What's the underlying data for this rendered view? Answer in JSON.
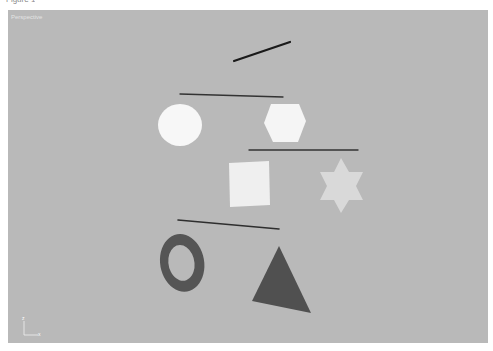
{
  "window": {
    "caption": "Figure 1"
  },
  "viewport": {
    "label": "Perspective",
    "background": "#b9b9b9"
  },
  "axis_gizmo": {
    "up_label": "z",
    "right_label": "x"
  },
  "scene": {
    "objects": [
      {
        "name": "line-1",
        "type": "line",
        "color": "#1a1a1a"
      },
      {
        "name": "line-2",
        "type": "line",
        "color": "#333333"
      },
      {
        "name": "circle",
        "type": "disc",
        "color": "#f7f7f7"
      },
      {
        "name": "hexagon",
        "type": "hexagon",
        "color": "#f5f5f5"
      },
      {
        "name": "line-3",
        "type": "line",
        "color": "#333333"
      },
      {
        "name": "square",
        "type": "plane",
        "color": "#efefef"
      },
      {
        "name": "star",
        "type": "star",
        "color": "#d9d9d9"
      },
      {
        "name": "line-4",
        "type": "line",
        "color": "#2e2e2e"
      },
      {
        "name": "torus",
        "type": "ring",
        "color": "#555555"
      },
      {
        "name": "triangle",
        "type": "triangle",
        "color": "#505050"
      }
    ]
  }
}
